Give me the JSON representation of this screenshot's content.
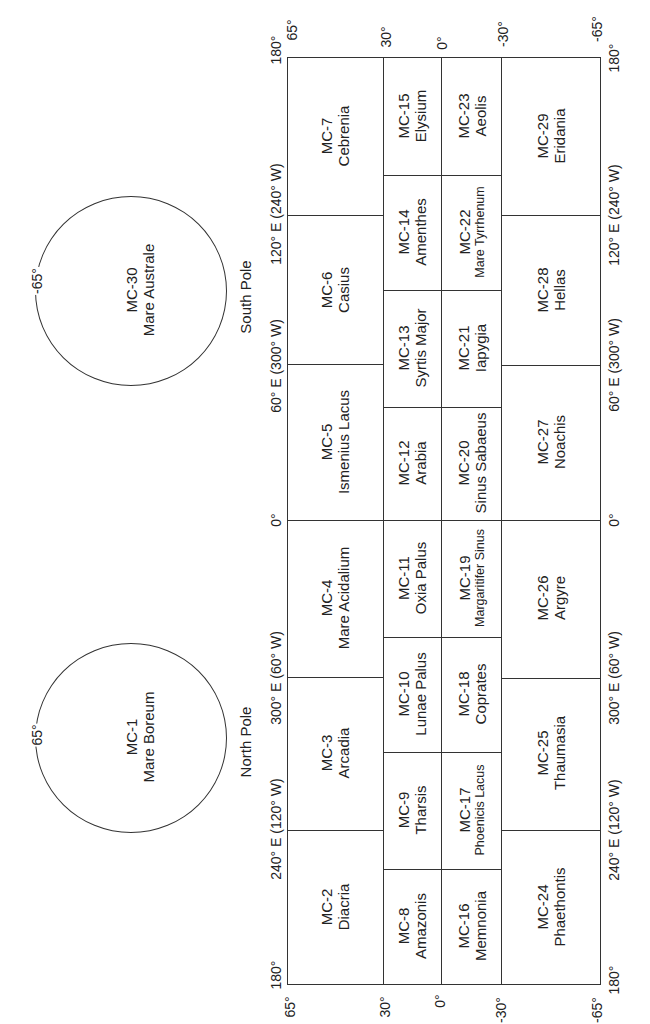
{
  "poles": {
    "south": {
      "label": "South Pole",
      "code": "MC-30",
      "name": "Mare Australe",
      "latitude_label": "-65°"
    },
    "north": {
      "label": "North Pole",
      "code": "MC-1",
      "name": "Mare Boreum",
      "latitude_label": "65°"
    }
  },
  "latitude_ticks": {
    "top": [
      "65°",
      "30°",
      "0°",
      "-30°",
      "-65°"
    ],
    "bottom": [
      "65°",
      "30°",
      "0°",
      "-30°",
      "-65°"
    ]
  },
  "longitude_ticks": {
    "top_corner_left": "180°",
    "top_corner_right": "180°",
    "bottom_corner_left": "180°",
    "bottom_corner_right": "180°",
    "left": [
      "120° E (240° W)",
      "60° E (300° W)",
      "0°",
      "300° E (60° W)",
      "240° E (120° W)"
    ],
    "right": [
      "120° E (240° W)",
      "60° E (300° W)",
      "0°",
      "300° E (60° W)",
      "240° E (120° W)"
    ]
  },
  "quadrangles": {
    "band_65_30": [
      {
        "code": "MC-7",
        "name": "Cebrenia"
      },
      {
        "code": "MC-6",
        "name": "Casius"
      },
      {
        "code": "MC-5",
        "name": "Ismenius Lacus"
      },
      {
        "code": "MC-4",
        "name": "Mare Acidalium"
      },
      {
        "code": "MC-3",
        "name": "Arcadia"
      },
      {
        "code": "MC-2",
        "name": "Diacria"
      }
    ],
    "band_30_0": [
      {
        "code": "MC-15",
        "name": "Elysium"
      },
      {
        "code": "MC-14",
        "name": "Amenthes"
      },
      {
        "code": "MC-13",
        "name": "Syrtis Major"
      },
      {
        "code": "MC-12",
        "name": "Arabia"
      },
      {
        "code": "MC-11",
        "name": "Oxia Palus"
      },
      {
        "code": "MC-10",
        "name": "Lunae Palus"
      },
      {
        "code": "MC-9",
        "name": "Tharsis"
      },
      {
        "code": "MC-8",
        "name": "Amazonis"
      }
    ],
    "band_0_-30": [
      {
        "code": "MC-23",
        "name": "Aeolis"
      },
      {
        "code": "MC-22",
        "name": "Mare Tyrrhenum"
      },
      {
        "code": "MC-21",
        "name": "Iapygia"
      },
      {
        "code": "MC-20",
        "name": "Sinus Sabaeus"
      },
      {
        "code": "MC-19",
        "name": "Margaritifer Sinus"
      },
      {
        "code": "MC-18",
        "name": "Coprates"
      },
      {
        "code": "MC-17",
        "name": "Phoenicis Lacus"
      },
      {
        "code": "MC-16",
        "name": "Memnonia"
      }
    ],
    "band_-30_-65": [
      {
        "code": "MC-29",
        "name": "Eridania"
      },
      {
        "code": "MC-28",
        "name": "Hellas"
      },
      {
        "code": "MC-27",
        "name": "Noachis"
      },
      {
        "code": "MC-26",
        "name": "Argyre"
      },
      {
        "code": "MC-25",
        "name": "Thaumasia"
      },
      {
        "code": "MC-24",
        "name": "Phaethontis"
      }
    ]
  }
}
